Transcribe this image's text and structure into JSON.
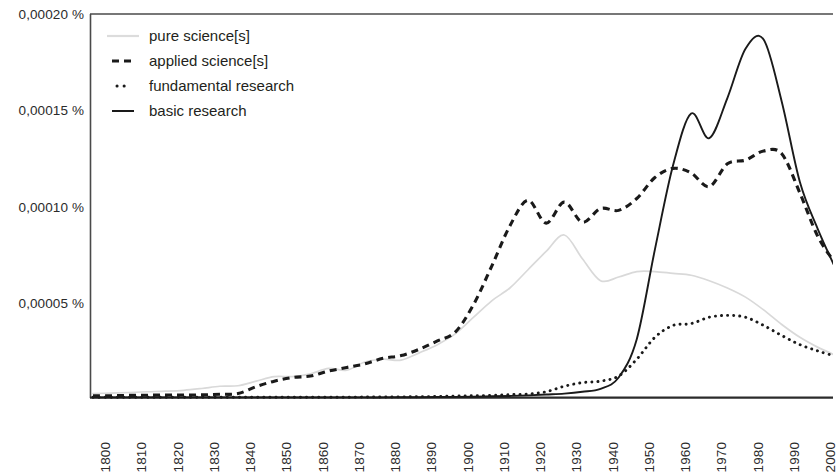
{
  "chart_data": {
    "type": "line",
    "title": "",
    "subtitle": "",
    "xlabel": "",
    "ylabel": "",
    "xlim": [
      1800,
      2005
    ],
    "ylim": [
      0,
      0.00021
    ],
    "grid": false,
    "legend_position": "top-left",
    "y_tick_labels": [
      "0,00005 %",
      "0,00010 %",
      "0,00015 %",
      "0,00020 %"
    ],
    "y_tick_values": [
      5e-05,
      0.0001,
      0.00015,
      0.0002
    ],
    "x_tick_labels": [
      "1800",
      "1810",
      "1820",
      "1830",
      "1840",
      "1850",
      "1860",
      "1870",
      "1880",
      "1890",
      "1900",
      "1910",
      "1920",
      "1930",
      "1940",
      "1950",
      "1960",
      "1970",
      "1980",
      "1990",
      "2000"
    ],
    "x_tick_values": [
      1800,
      1810,
      1820,
      1830,
      1840,
      1850,
      1860,
      1870,
      1880,
      1890,
      1900,
      1910,
      1920,
      1930,
      1940,
      1950,
      1960,
      1970,
      1980,
      1990,
      2000
    ],
    "x": [
      1800,
      1805,
      1810,
      1815,
      1820,
      1825,
      1830,
      1835,
      1840,
      1845,
      1850,
      1855,
      1860,
      1865,
      1870,
      1875,
      1880,
      1885,
      1890,
      1895,
      1900,
      1905,
      1910,
      1915,
      1920,
      1925,
      1930,
      1935,
      1940,
      1945,
      1950,
      1955,
      1960,
      1965,
      1970,
      1975,
      1980,
      1985,
      1990,
      1995,
      2000,
      2005
    ],
    "series": [
      {
        "name": "pure science[s]",
        "style": "solid-light",
        "color": "#d9d9d9",
        "values": [
          2.2e-06,
          2.5e-06,
          2.8e-06,
          3.2e-06,
          3.5e-06,
          4e-06,
          5e-06,
          6.2e-06,
          6.5e-06,
          9e-06,
          1.15e-05,
          1.15e-05,
          1.3e-05,
          1.6e-05,
          1.5e-05,
          1.95e-05,
          2.1e-05,
          2.05e-05,
          2.45e-05,
          2.9e-05,
          3.5e-05,
          4.4e-05,
          5.3e-05,
          6e-05,
          7e-05,
          8e-05,
          8.9e-05,
          7.6e-05,
          6.4e-05,
          6.6e-05,
          6.9e-05,
          6.9e-05,
          6.8e-05,
          6.7e-05,
          6.4e-05,
          6e-05,
          5.5e-05,
          4.8e-05,
          4e-05,
          3.3e-05,
          2.75e-05,
          2.3e-05
        ]
      },
      {
        "name": "applied science[s]",
        "style": "dashed",
        "color": "#1a1a1a",
        "values": [
          1e-06,
          1e-06,
          1.2e-06,
          1.3e-06,
          1.4e-06,
          1.4e-06,
          1.5e-06,
          1.8e-06,
          2.2e-06,
          6e-06,
          9e-06,
          1.1e-05,
          1.18e-05,
          1.45e-05,
          1.65e-05,
          1.85e-05,
          2.15e-05,
          2.3e-05,
          2.65e-05,
          3.1e-05,
          3.6e-05,
          5.1e-05,
          7.2e-05,
          9.4e-05,
          0.000108,
          9.55e-05,
          0.000107,
          9.6e-05,
          0.0001035,
          0.0001025,
          0.000109,
          0.0001205,
          0.0001255,
          0.000123,
          0.0001155,
          0.000128,
          0.00013,
          0.000135,
          0.0001335,
          0.000112,
          8.8e-05,
          7.3e-05
        ]
      },
      {
        "name": "fundamental research",
        "style": "dotted",
        "color": "#1a1a1a",
        "values": [
          2e-07,
          2e-07,
          2e-07,
          2e-07,
          2e-07,
          2e-07,
          2e-07,
          2e-07,
          2e-07,
          2e-07,
          2e-07,
          2e-07,
          2e-07,
          2e-07,
          2e-07,
          3e-07,
          3e-07,
          4e-07,
          5e-07,
          6e-07,
          8e-07,
          1e-06,
          1.2e-06,
          1.6e-06,
          2e-06,
          3.2e-06,
          6.2e-06,
          8.2e-06,
          9e-06,
          1.18e-05,
          2.1e-05,
          3.3e-05,
          3.95e-05,
          4.05e-05,
          4.4e-05,
          4.5e-05,
          4.4e-05,
          3.95e-05,
          3.4e-05,
          2.9e-05,
          2.55e-05,
          2.25e-05
        ]
      },
      {
        "name": "basic research",
        "style": "solid",
        "color": "#1a1a1a",
        "values": [
          1e-07,
          1e-07,
          1e-07,
          1e-07,
          1e-07,
          1e-07,
          1e-07,
          1e-07,
          1e-07,
          1e-07,
          1e-07,
          1e-07,
          1e-07,
          1e-07,
          1e-07,
          1e-07,
          1e-07,
          2e-07,
          2e-07,
          3e-07,
          4e-07,
          5e-07,
          7e-07,
          9e-07,
          1.2e-06,
          1.7e-06,
          2.2e-06,
          3.2e-06,
          4.8e-06,
          1.1e-05,
          3.2e-05,
          8.1e-05,
          0.000127,
          0.0001555,
          0.000142,
          0.000164,
          0.000191,
          0.000196,
          0.000162,
          0.000118,
          9.2e-05,
          7e-05
        ]
      }
    ]
  },
  "legend": {
    "items": [
      {
        "label": "pure science[s]",
        "swatch": "solid-light-line-icon"
      },
      {
        "label": "applied science[s]",
        "swatch": "dashed-line-icon"
      },
      {
        "label": "fundamental research",
        "swatch": "dotted-line-icon"
      },
      {
        "label": "basic research",
        "swatch": "solid-line-icon"
      }
    ]
  },
  "axes": {
    "y_labels": [
      "0,00020 %",
      "0,00015 %",
      "0,00010 %",
      "0,00005 %"
    ],
    "x_labels": [
      "1800",
      "1810",
      "1820",
      "1830",
      "1840",
      "1850",
      "1860",
      "1870",
      "1880",
      "1890",
      "1900",
      "1910",
      "1920",
      "1930",
      "1940",
      "1950",
      "1960",
      "1970",
      "1980",
      "1990",
      "2000"
    ]
  },
  "colors": {
    "axis": "#4a4a4a",
    "ink": "#1a1a1a",
    "light_series": "#d9d9d9",
    "background": "#ffffff"
  }
}
